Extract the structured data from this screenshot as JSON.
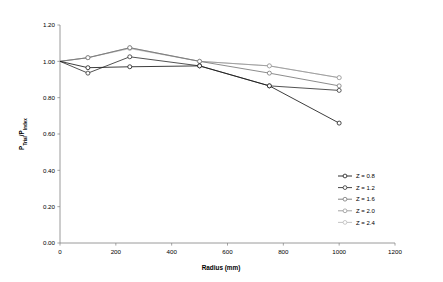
{
  "chart_data": {
    "type": "line",
    "title": "",
    "xlabel": "Radius (mm)",
    "ylabel": "Ptrial/Pindex",
    "xlim": [
      0,
      1200
    ],
    "ylim": [
      0.0,
      1.2
    ],
    "xticks": [
      "0",
      "200",
      "400",
      "600",
      "800",
      "1000",
      "1200"
    ],
    "xtick_values": [
      0,
      200,
      400,
      600,
      800,
      1000,
      1200
    ],
    "yticks": [
      "0.00",
      "0.20",
      "0.40",
      "0.60",
      "0.80",
      "1.00",
      "1.20"
    ],
    "ytick_values": [
      0.0,
      0.2,
      0.4,
      0.6,
      0.8,
      1.0,
      1.2
    ],
    "grid": false,
    "legend_position": "right-lower",
    "x": [
      0,
      100,
      250,
      500,
      750,
      1000
    ],
    "series": [
      {
        "name": "Z = 0.8",
        "color": "#1a1a1a",
        "marker": "circle",
        "values": [
          1.0,
          0.965,
          0.97,
          0.975,
          0.865,
          0.66
        ]
      },
      {
        "name": "Z = 1.2",
        "color": "#333333",
        "marker": "circle",
        "values": [
          1.0,
          0.935,
          1.025,
          0.975,
          0.865,
          0.84
        ]
      },
      {
        "name": "Z = 1.6",
        "color": "#777777",
        "marker": "circle",
        "values": [
          1.0,
          1.02,
          1.075,
          1.0,
          0.935,
          0.865
        ]
      },
      {
        "name": "Z = 2.0",
        "color": "#9a9a9a",
        "marker": "circle",
        "values": [
          1.0,
          1.02,
          1.075,
          1.0,
          0.975,
          0.91
        ]
      },
      {
        "name": "Z = 2.4",
        "color": "#bdbdbd",
        "marker": "circle",
        "values": [
          1.0,
          1.02,
          1.07,
          1.0,
          0.975,
          0.91
        ]
      }
    ]
  },
  "axes": {
    "x_title": "Radius (mm)",
    "y_title_main": "P",
    "y_title_sub1": "Trial",
    "y_title_mid": "/P",
    "y_title_sub2": "Index"
  },
  "legend": {
    "entries": [
      {
        "label": "Z = 0.8"
      },
      {
        "label": "Z = 1.2"
      },
      {
        "label": "Z = 1.6"
      },
      {
        "label": "Z = 2.0"
      },
      {
        "label": "Z = 2.4"
      }
    ]
  }
}
